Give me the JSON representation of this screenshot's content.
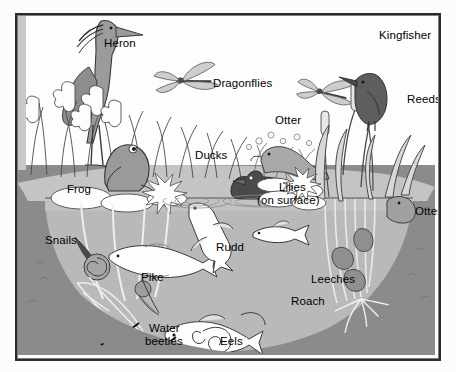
{
  "illustration": {
    "title": "Pond life cross-section",
    "frame": {
      "border_color": "#2b2b2b",
      "background": "#fdfdfd"
    },
    "colors": {
      "sky": "#fdfdfd",
      "water": "#b9b9b9",
      "water_surface_band": "#cfcfcf",
      "soil_bank": "#8b8b8b",
      "bank_top": "#c4c4c4",
      "animal_fill": "#ffffff",
      "animal_shade": "#9a9a9a",
      "dark_ink": "#1a1a1a",
      "label_text": "#000000"
    },
    "waterline_y": 183
  },
  "labels": [
    {
      "id": "heron",
      "text": "Heron"
    },
    {
      "id": "dragonflies",
      "text": "Dragonflies"
    },
    {
      "id": "kingfisher",
      "text": "Kingfisher"
    },
    {
      "id": "reeds",
      "text": "Reeds"
    },
    {
      "id": "otter-bank",
      "text": "Otter"
    },
    {
      "id": "ducks",
      "text": "Ducks"
    },
    {
      "id": "frog",
      "text": "Frog"
    },
    {
      "id": "lilies",
      "text": "Lilies\n(on surface)"
    },
    {
      "id": "lilies-line1",
      "text": "Lilies"
    },
    {
      "id": "lilies-line2",
      "text": "(on surface)"
    },
    {
      "id": "otter-right",
      "text": "Otter"
    },
    {
      "id": "snails",
      "text": "Snails"
    },
    {
      "id": "rudd",
      "text": "Rudd"
    },
    {
      "id": "pike",
      "text": "Pike"
    },
    {
      "id": "leeches",
      "text": "Leeches"
    },
    {
      "id": "roach",
      "text": "Roach"
    },
    {
      "id": "water-beetles-line1",
      "text": "Water"
    },
    {
      "id": "water-beetles-line2",
      "text": "beetles"
    },
    {
      "id": "eels",
      "text": "Eels"
    }
  ]
}
